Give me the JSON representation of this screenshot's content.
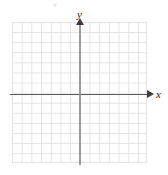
{
  "figure": {
    "type": "blank-cartesian-coordinate-plane",
    "background_color": "#ffffff"
  },
  "chart_data": {
    "type": "scatter",
    "title": "",
    "xlabel": "x",
    "ylabel": "y",
    "x": [],
    "y": [],
    "series": [],
    "annotations": [],
    "grid": true,
    "legend": false,
    "grid_columns": 14,
    "grid_rows": 14,
    "xlim": [
      -7,
      7
    ],
    "ylim": [
      -7,
      7
    ],
    "xticks": [],
    "yticks": [],
    "tick_labels_visible": false,
    "colors": {
      "grid": "#e3e3e6",
      "x_axis": "#575757",
      "y_axis": "#9a9a9a",
      "arrow": "#3d3d3d",
      "label": "#1e1e1e"
    }
  },
  "axes": {
    "x_label": "x",
    "y_label": "y"
  },
  "artifact": {
    "top_mark": "x"
  }
}
